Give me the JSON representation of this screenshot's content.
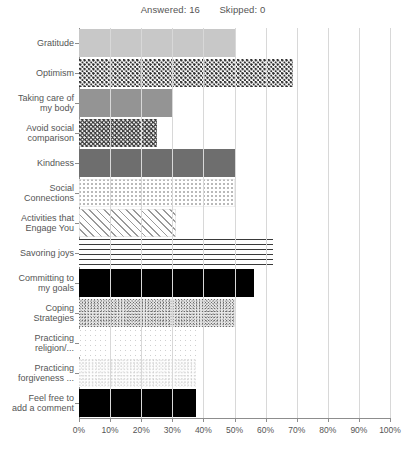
{
  "header": {
    "answered_label": "Answered: 16",
    "skipped_label": "Skipped: 0"
  },
  "chart_data": {
    "type": "bar",
    "orientation": "horizontal",
    "title": "",
    "subtitle": "",
    "xlabel": "",
    "ylabel": "",
    "xlim": [
      0,
      100
    ],
    "grid": true,
    "legend": "none",
    "answered": 16,
    "skipped": 0,
    "xticks": [
      "0%",
      "10%",
      "20%",
      "30%",
      "40%",
      "50%",
      "60%",
      "70%",
      "80%",
      "90%",
      "100%"
    ],
    "xtick_values": [
      0,
      10,
      20,
      30,
      40,
      50,
      60,
      70,
      80,
      90,
      100
    ],
    "categories": [
      "Gratitude",
      "Optimism",
      "Taking care of my body",
      "Avoid social comparison",
      "Kindness",
      "Social Connections",
      "Activities that Engage You",
      "Savoring joys",
      "Committing to my goals",
      "Coping Strategies",
      "Practicing religion/...",
      "Practicing forgiveness ...",
      "Feel free to add a comment"
    ],
    "category_lines": [
      [
        "Gratitude"
      ],
      [
        "Optimism"
      ],
      [
        "Taking care of",
        "my body"
      ],
      [
        "Avoid social",
        "comparison"
      ],
      [
        "Kindness"
      ],
      [
        "Social",
        "Connections"
      ],
      [
        "Activities that",
        "Engage You"
      ],
      [
        "Savoring joys"
      ],
      [
        "Committing to",
        "my goals"
      ],
      [
        "Coping",
        "Strategies"
      ],
      [
        "Practicing",
        "religion/..."
      ],
      [
        "Practicing",
        "forgiveness ..."
      ],
      [
        "Feel free to",
        "add a comment"
      ]
    ],
    "values": [
      50,
      68.75,
      30,
      25,
      50,
      50,
      31.25,
      62.5,
      56.25,
      50,
      37.5,
      37.5,
      37.5
    ],
    "patterns": [
      "solid-light",
      "checker",
      "solid-med",
      "checker-dark",
      "solid-dark",
      "dots-light",
      "diagonal",
      "hlines",
      "solid-black",
      "speckle",
      "dots-faint",
      "speckle-faint",
      "solid-black"
    ]
  },
  "colors": {
    "axis": "#8d8d8d",
    "grid": "#d8d8d8",
    "text": "#555555",
    "background": "#ffffff"
  }
}
